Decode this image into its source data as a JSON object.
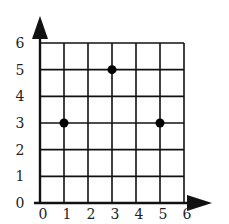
{
  "chart_data": {
    "type": "scatter",
    "title": "",
    "xlabel": "",
    "ylabel": "",
    "xlim": [
      0,
      6
    ],
    "ylim": [
      0,
      6
    ],
    "grid": true,
    "x_ticks": [
      "0",
      "1",
      "2",
      "3",
      "4",
      "5",
      "6"
    ],
    "y_ticks": [
      "0",
      "1",
      "2",
      "3",
      "4",
      "5",
      "6"
    ],
    "points": [
      {
        "x": 1,
        "y": 3
      },
      {
        "x": 3,
        "y": 5
      },
      {
        "x": 5,
        "y": 3
      }
    ]
  },
  "colors": {
    "line": "#111111",
    "point": "#000000",
    "label": "#222222"
  }
}
